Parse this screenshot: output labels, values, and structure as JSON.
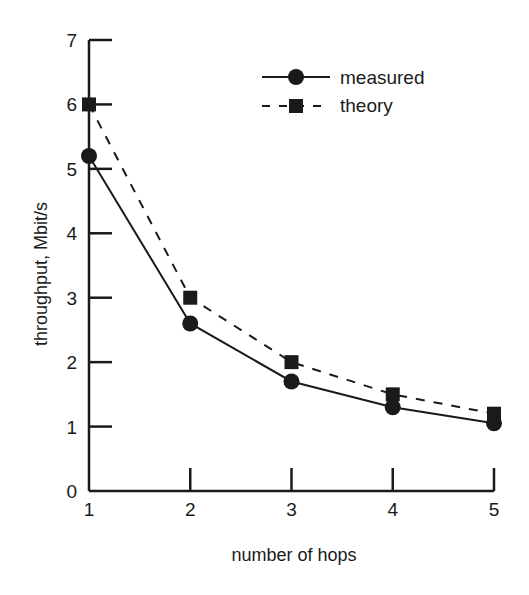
{
  "chart_data": {
    "type": "line",
    "title": "",
    "xlabel": "number of hops",
    "ylabel": "throughput, Mbit/s",
    "x": [
      1,
      2,
      3,
      4,
      5
    ],
    "xlim": [
      1,
      5
    ],
    "ylim": [
      0,
      7
    ],
    "xticks": [
      "1",
      "2",
      "3",
      "4",
      "5"
    ],
    "yticks": [
      "0",
      "1",
      "2",
      "3",
      "4",
      "5",
      "6",
      "7"
    ],
    "grid": false,
    "legend_position": "upper right",
    "series": [
      {
        "name": "measured",
        "style": "solid",
        "marker": "circle",
        "values": [
          5.2,
          2.6,
          1.7,
          1.3,
          1.05
        ]
      },
      {
        "name": "theory",
        "style": "dashed",
        "marker": "square",
        "values": [
          6.0,
          3.0,
          2.0,
          1.5,
          1.2
        ]
      }
    ]
  },
  "legend": {
    "items": [
      {
        "label": "measured"
      },
      {
        "label": "theory"
      }
    ]
  },
  "colors": {
    "ink": "#1a1a1a",
    "background": "#ffffff"
  }
}
